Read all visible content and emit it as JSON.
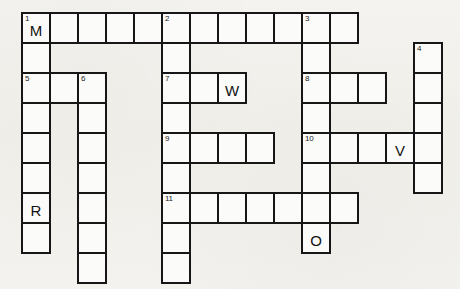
{
  "puzzle": {
    "title": "Crossword Grid",
    "cell_size": 28,
    "row_height": 30,
    "origin_x": 21,
    "origin_y": 12,
    "colors": {
      "paper": "#f2f1ed",
      "cell_fill": "#fbfbf9",
      "cell_border": "#161616",
      "text": "#121212"
    },
    "clue_numbers": [
      1,
      2,
      3,
      4,
      5,
      6,
      7,
      8,
      9,
      10,
      11
    ],
    "filled_letters": [
      "M",
      "W",
      "R",
      "V",
      "O"
    ],
    "cells": [
      {
        "id": "c-r0-0",
        "row": 0,
        "col": 0,
        "num": "1",
        "letter": "M"
      },
      {
        "id": "c-r0-1",
        "row": 0,
        "col": 1,
        "num": "",
        "letter": ""
      },
      {
        "id": "c-r0-2",
        "row": 0,
        "col": 2,
        "num": "",
        "letter": ""
      },
      {
        "id": "c-r0-3",
        "row": 0,
        "col": 3,
        "num": "",
        "letter": ""
      },
      {
        "id": "c-r0-4",
        "row": 0,
        "col": 4,
        "num": "",
        "letter": ""
      },
      {
        "id": "c-r0-5",
        "row": 0,
        "col": 5,
        "num": "2",
        "letter": ""
      },
      {
        "id": "c-r0-6",
        "row": 0,
        "col": 6,
        "num": "",
        "letter": ""
      },
      {
        "id": "c-r0-7",
        "row": 0,
        "col": 7,
        "num": "",
        "letter": ""
      },
      {
        "id": "c-r0-8",
        "row": 0,
        "col": 8,
        "num": "",
        "letter": ""
      },
      {
        "id": "c-r0-9",
        "row": 0,
        "col": 9,
        "num": "",
        "letter": ""
      },
      {
        "id": "c-r0-10",
        "row": 0,
        "col": 10,
        "num": "3",
        "letter": ""
      },
      {
        "id": "c-r0-11",
        "row": 0,
        "col": 11,
        "num": "",
        "letter": ""
      },
      {
        "id": "c-r1-0",
        "row": 1,
        "col": 0,
        "num": "",
        "letter": ""
      },
      {
        "id": "c-r1-5",
        "row": 1,
        "col": 5,
        "num": "",
        "letter": ""
      },
      {
        "id": "c-r1-10",
        "row": 1,
        "col": 10,
        "num": "",
        "letter": ""
      },
      {
        "id": "c-r1-14",
        "row": 1,
        "col": 14,
        "num": "4",
        "letter": ""
      },
      {
        "id": "c-r2-0",
        "row": 2,
        "col": 0,
        "num": "5",
        "letter": ""
      },
      {
        "id": "c-r2-1",
        "row": 2,
        "col": 1,
        "num": "",
        "letter": ""
      },
      {
        "id": "c-r2-2",
        "row": 2,
        "col": 2,
        "num": "6",
        "letter": ""
      },
      {
        "id": "c-r2-5",
        "row": 2,
        "col": 5,
        "num": "7",
        "letter": ""
      },
      {
        "id": "c-r2-6",
        "row": 2,
        "col": 6,
        "num": "",
        "letter": ""
      },
      {
        "id": "c-r2-7",
        "row": 2,
        "col": 7,
        "num": "",
        "letter": "W"
      },
      {
        "id": "c-r2-10",
        "row": 2,
        "col": 10,
        "num": "8",
        "letter": ""
      },
      {
        "id": "c-r2-11",
        "row": 2,
        "col": 11,
        "num": "",
        "letter": ""
      },
      {
        "id": "c-r2-12",
        "row": 2,
        "col": 12,
        "num": "",
        "letter": ""
      },
      {
        "id": "c-r2-14",
        "row": 2,
        "col": 14,
        "num": "",
        "letter": ""
      },
      {
        "id": "c-r3-0",
        "row": 3,
        "col": 0,
        "num": "",
        "letter": ""
      },
      {
        "id": "c-r3-2",
        "row": 3,
        "col": 2,
        "num": "",
        "letter": ""
      },
      {
        "id": "c-r3-5",
        "row": 3,
        "col": 5,
        "num": "",
        "letter": ""
      },
      {
        "id": "c-r3-10",
        "row": 3,
        "col": 10,
        "num": "",
        "letter": ""
      },
      {
        "id": "c-r3-14",
        "row": 3,
        "col": 14,
        "num": "",
        "letter": ""
      },
      {
        "id": "c-r4-0",
        "row": 4,
        "col": 0,
        "num": "",
        "letter": ""
      },
      {
        "id": "c-r4-2",
        "row": 4,
        "col": 2,
        "num": "",
        "letter": ""
      },
      {
        "id": "c-r4-5",
        "row": 4,
        "col": 5,
        "num": "9",
        "letter": ""
      },
      {
        "id": "c-r4-6",
        "row": 4,
        "col": 6,
        "num": "",
        "letter": ""
      },
      {
        "id": "c-r4-7",
        "row": 4,
        "col": 7,
        "num": "",
        "letter": ""
      },
      {
        "id": "c-r4-8",
        "row": 4,
        "col": 8,
        "num": "",
        "letter": ""
      },
      {
        "id": "c-r4-10",
        "row": 4,
        "col": 10,
        "num": "10",
        "letter": ""
      },
      {
        "id": "c-r4-11",
        "row": 4,
        "col": 11,
        "num": "",
        "letter": ""
      },
      {
        "id": "c-r4-12",
        "row": 4,
        "col": 12,
        "num": "",
        "letter": ""
      },
      {
        "id": "c-r4-13",
        "row": 4,
        "col": 13,
        "num": "",
        "letter": "V"
      },
      {
        "id": "c-r4-14",
        "row": 4,
        "col": 14,
        "num": "",
        "letter": ""
      },
      {
        "id": "c-r5-0",
        "row": 5,
        "col": 0,
        "num": "",
        "letter": ""
      },
      {
        "id": "c-r5-2",
        "row": 5,
        "col": 2,
        "num": "",
        "letter": ""
      },
      {
        "id": "c-r5-5",
        "row": 5,
        "col": 5,
        "num": "",
        "letter": ""
      },
      {
        "id": "c-r5-10",
        "row": 5,
        "col": 10,
        "num": "",
        "letter": ""
      },
      {
        "id": "c-r5-14",
        "row": 5,
        "col": 14,
        "num": "",
        "letter": ""
      },
      {
        "id": "c-r6-0",
        "row": 6,
        "col": 0,
        "num": "",
        "letter": "R"
      },
      {
        "id": "c-r6-2",
        "row": 6,
        "col": 2,
        "num": "",
        "letter": ""
      },
      {
        "id": "c-r6-5",
        "row": 6,
        "col": 5,
        "num": "11",
        "letter": ""
      },
      {
        "id": "c-r6-6",
        "row": 6,
        "col": 6,
        "num": "",
        "letter": ""
      },
      {
        "id": "c-r6-7",
        "row": 6,
        "col": 7,
        "num": "",
        "letter": ""
      },
      {
        "id": "c-r6-8",
        "row": 6,
        "col": 8,
        "num": "",
        "letter": ""
      },
      {
        "id": "c-r6-9",
        "row": 6,
        "col": 9,
        "num": "",
        "letter": ""
      },
      {
        "id": "c-r6-10",
        "row": 6,
        "col": 10,
        "num": "",
        "letter": ""
      },
      {
        "id": "c-r6-11",
        "row": 6,
        "col": 11,
        "num": "",
        "letter": ""
      },
      {
        "id": "c-r7-0",
        "row": 7,
        "col": 0,
        "num": "",
        "letter": ""
      },
      {
        "id": "c-r7-2",
        "row": 7,
        "col": 2,
        "num": "",
        "letter": ""
      },
      {
        "id": "c-r7-5",
        "row": 7,
        "col": 5,
        "num": "",
        "letter": ""
      },
      {
        "id": "c-r7-10",
        "row": 7,
        "col": 10,
        "num": "",
        "letter": "O"
      },
      {
        "id": "c-r8-2",
        "row": 8,
        "col": 2,
        "num": "",
        "letter": ""
      },
      {
        "id": "c-r8-5",
        "row": 8,
        "col": 5,
        "num": "",
        "letter": ""
      }
    ]
  }
}
